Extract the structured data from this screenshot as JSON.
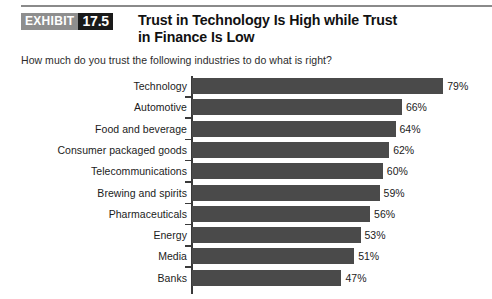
{
  "exhibit": {
    "word": "EXHIBIT",
    "number": "17.5"
  },
  "title": {
    "line1": "Trust in Technology Is High while Trust",
    "line2": "in Finance Is Low"
  },
  "subtitle": "How much do you trust the following industries to do what is right?",
  "colors": {
    "bar": "#4a4a4a",
    "axis": "#3a3a3a",
    "badge_gray": "#8e8e8e",
    "badge_black": "#1a1a1a",
    "rule": "#8a8a8a"
  },
  "chart_data": {
    "type": "bar",
    "orientation": "horizontal",
    "title": "Trust in Technology Is High while Trust in Finance Is Low",
    "subtitle": "How much do you trust the following industries to do what is right?",
    "xlabel": "",
    "ylabel": "",
    "xlim": [
      0,
      90
    ],
    "grid": false,
    "legend": false,
    "categories": [
      "Technology",
      "Automotive",
      "Food and beverage",
      "Consumer packaged goods",
      "Telecommunications",
      "Brewing and spirits",
      "Pharmaceuticals",
      "Energy",
      "Media",
      "Banks"
    ],
    "values": [
      79,
      66,
      64,
      62,
      60,
      59,
      56,
      53,
      51,
      47
    ],
    "value_labels": [
      "79%",
      "66%",
      "64%",
      "62%",
      "60%",
      "59%",
      "56%",
      "53%",
      "51%",
      "47%"
    ]
  }
}
